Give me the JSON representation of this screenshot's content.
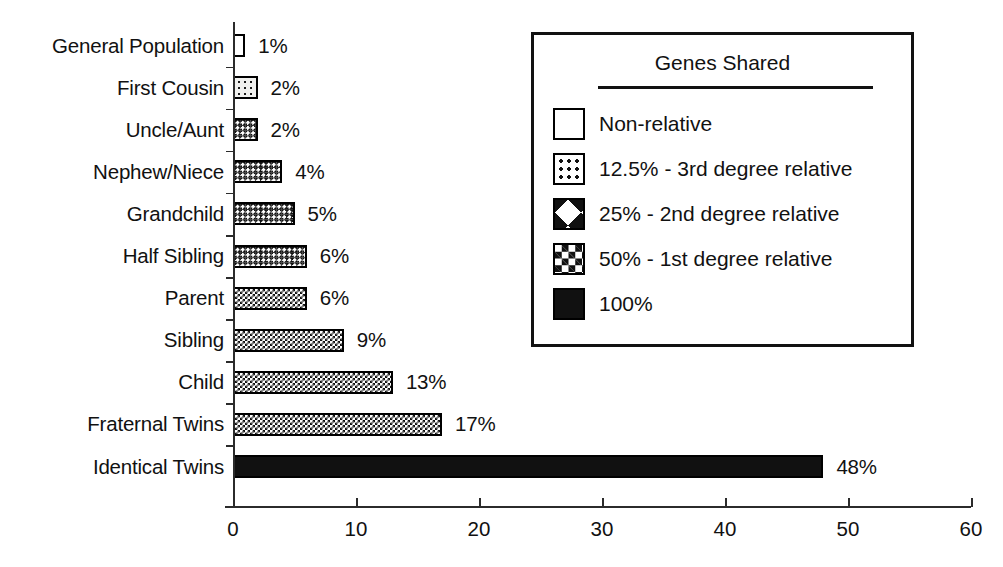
{
  "chart_data": {
    "type": "bar",
    "orientation": "horizontal",
    "title": "",
    "xlabel": "",
    "ylabel": "",
    "xlim": [
      0,
      60
    ],
    "xticks": [
      0,
      10,
      20,
      30,
      40,
      50,
      60
    ],
    "xtick_labels": [
      "0",
      "10",
      "20",
      "30",
      "40",
      "50",
      "60"
    ],
    "grid": false,
    "value_suffix": "%",
    "categories": [
      "General Population",
      "First Cousin",
      "Uncle/Aunt",
      "Nephew/Niece",
      "Grandchild",
      "Half Sibling",
      "Parent",
      "Sibling",
      "Child",
      "Fraternal Twins",
      "Identical Twins"
    ],
    "values": [
      1,
      2,
      2,
      4,
      5,
      6,
      6,
      9,
      13,
      17,
      48
    ],
    "value_labels": [
      "1%",
      "2%",
      "2%",
      "4%",
      "5%",
      "6%",
      "6%",
      "9%",
      "13%",
      "17%",
      "48%"
    ],
    "patterns": [
      "none",
      "dots",
      "cross",
      "cross",
      "cross",
      "cross",
      "checker",
      "checker",
      "checker",
      "checker",
      "solid"
    ],
    "bars": [
      {
        "category": "General Population",
        "value": 1,
        "label": "1%",
        "pattern": "none"
      },
      {
        "category": "First Cousin",
        "value": 2,
        "label": "2%",
        "pattern": "dots"
      },
      {
        "category": "Uncle/Aunt",
        "value": 2,
        "label": "2%",
        "pattern": "cross"
      },
      {
        "category": "Nephew/Niece",
        "value": 4,
        "label": "4%",
        "pattern": "cross"
      },
      {
        "category": "Grandchild",
        "value": 5,
        "label": "5%",
        "pattern": "cross"
      },
      {
        "category": "Half Sibling",
        "value": 6,
        "label": "6%",
        "pattern": "cross"
      },
      {
        "category": "Parent",
        "value": 6,
        "label": "6%",
        "pattern": "checker"
      },
      {
        "category": "Sibling",
        "value": 9,
        "label": "9%",
        "pattern": "checker"
      },
      {
        "category": "Child",
        "value": 13,
        "label": "13%",
        "pattern": "checker"
      },
      {
        "category": "Fraternal Twins",
        "value": 17,
        "label": "17%",
        "pattern": "checker"
      },
      {
        "category": "Identical Twins",
        "value": 48,
        "label": "48%",
        "pattern": "solid"
      }
    ],
    "legend": {
      "title": "Genes Shared",
      "position": "top-right",
      "entries": [
        {
          "label": "Non-relative",
          "pattern": "none"
        },
        {
          "label": "12.5% - 3rd degree relative",
          "pattern": "dots"
        },
        {
          "label": "25% - 2nd degree relative",
          "pattern": "cross"
        },
        {
          "label": "50% - 1st degree relative",
          "pattern": "checker"
        },
        {
          "label": "100%",
          "pattern": "solid"
        }
      ]
    },
    "colors": {
      "ink": "#111111",
      "axis": "#2b2b2b",
      "background": "#ffffff"
    }
  }
}
